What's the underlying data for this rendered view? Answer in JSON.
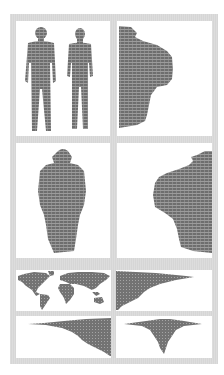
{
  "figure": {
    "colors": {
      "frame": "#dadada",
      "panel_background": "#ffffff",
      "shape_fill": "#6f6f6f",
      "shape_stripe_light": "#9a9a9a"
    },
    "panels": [
      {
        "id": "top-left",
        "content": "two-standing-human-silhouettes-front-view"
      },
      {
        "id": "top-right",
        "content": "side-profile-silhouette-cropped-left"
      },
      {
        "id": "middle-left",
        "content": "back-view-upper-body-silhouette"
      },
      {
        "id": "middle-right",
        "content": "side-profile-silhouette-cropped-right"
      },
      {
        "id": "bottom-1-left",
        "content": "world-map-silhouette"
      },
      {
        "id": "bottom-1-right",
        "content": "right-pointing-triangular-distribution"
      },
      {
        "id": "bottom-2-left",
        "content": "left-pointing-triangular-distribution"
      },
      {
        "id": "bottom-2-right",
        "content": "downward-triangular-distribution"
      }
    ]
  }
}
